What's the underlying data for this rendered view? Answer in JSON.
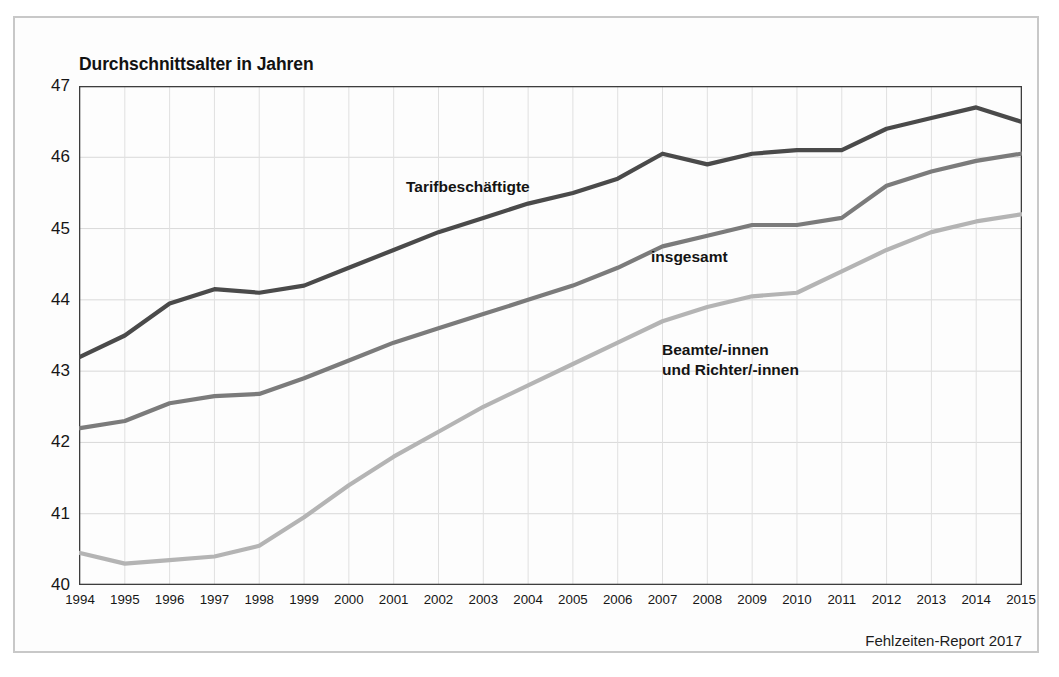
{
  "figure": {
    "source_note": "Fehlzeiten-Report 2017",
    "frame_color": "#c8c8c8",
    "background": "#ffffff"
  },
  "chart_data": {
    "type": "line",
    "title": "Durchschnittsalter in Jahren",
    "xlabel": "",
    "ylabel": "",
    "ylim": [
      40,
      47
    ],
    "yticks": [
      40,
      41,
      42,
      43,
      44,
      45,
      46,
      47
    ],
    "grid": true,
    "legend_position": "inline-labels",
    "categories": [
      "1994",
      "1995",
      "1996",
      "1997",
      "1998",
      "1999",
      "2000",
      "2001",
      "2002",
      "2003",
      "2004",
      "2005",
      "2006",
      "2007",
      "2008",
      "2009",
      "2010",
      "2011",
      "2012",
      "2013",
      "2014",
      "2015"
    ],
    "series": [
      {
        "name": "Tarifbeschäftigte",
        "color": "#4a4a4a",
        "values": [
          43.2,
          43.5,
          43.95,
          44.15,
          44.1,
          44.2,
          44.45,
          44.7,
          44.95,
          45.15,
          45.35,
          45.5,
          45.7,
          46.05,
          45.9,
          46.05,
          46.1,
          46.1,
          46.4,
          46.55,
          46.7,
          46.5
        ]
      },
      {
        "name": "insgesamt",
        "color": "#7b7b7b",
        "values": [
          42.2,
          42.3,
          42.55,
          42.65,
          42.68,
          42.9,
          43.15,
          43.4,
          43.6,
          43.8,
          44.0,
          44.2,
          44.45,
          44.75,
          44.9,
          45.05,
          45.05,
          45.15,
          45.6,
          45.8,
          45.95,
          46.05
        ]
      },
      {
        "name": "Beamte/-innen und Richter/-innen",
        "color": "#b4b4b4",
        "values": [
          40.45,
          40.3,
          40.35,
          40.4,
          40.55,
          40.95,
          41.4,
          41.8,
          42.15,
          42.5,
          42.8,
          43.1,
          43.4,
          43.7,
          43.9,
          44.05,
          44.1,
          44.4,
          44.7,
          44.95,
          45.1,
          45.2
        ]
      }
    ],
    "annotations": [
      {
        "text": "Tarifbeschäftigte",
        "series": "Tarifbeschäftigte"
      },
      {
        "text": "insgesamt",
        "series": "insgesamt"
      },
      {
        "text": "Beamte/-innen\nund Richter/-innen",
        "series": "Beamte/-innen und Richter/-innen"
      }
    ]
  }
}
